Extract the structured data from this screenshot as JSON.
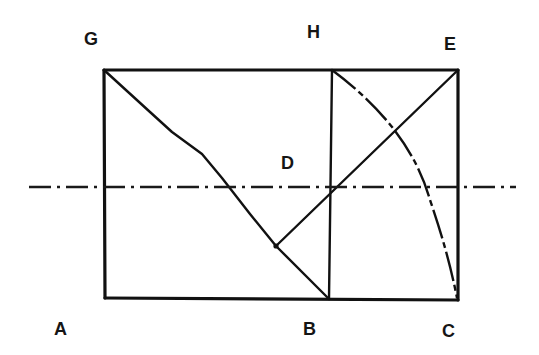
{
  "diagram": {
    "title": "",
    "colors": {
      "background": "#ffffff",
      "ink": "#111111"
    },
    "points": {
      "G": {
        "label": "G",
        "x": 104,
        "y": 70,
        "label_x": 93,
        "label_y": 45
      },
      "H": {
        "label": "H",
        "x": 331,
        "y": 70,
        "label_x": 315,
        "label_y": 38
      },
      "E": {
        "label": "E",
        "x": 458,
        "y": 70,
        "label_x": 451,
        "label_y": 50
      },
      "D": {
        "label": "D",
        "x": 331,
        "y": 187,
        "label_x": 289,
        "label_y": 169
      },
      "A": {
        "label": "A",
        "x": 105,
        "y": 298,
        "label_x": 62,
        "label_y": 335
      },
      "B": {
        "label": "B",
        "x": 329,
        "y": 299,
        "label_x": 311,
        "label_y": 335
      },
      "C": {
        "label": "C",
        "x": 458,
        "y": 300,
        "label_x": 450,
        "label_y": 337
      }
    },
    "kink_point": {
      "x": 276,
      "y": 246
    },
    "axis": {
      "type": "dash-dot",
      "x1": 29,
      "y1": 187,
      "x2": 516,
      "y2": 187
    },
    "labels": [
      "G",
      "H",
      "E",
      "D",
      "A",
      "B",
      "C"
    ]
  }
}
